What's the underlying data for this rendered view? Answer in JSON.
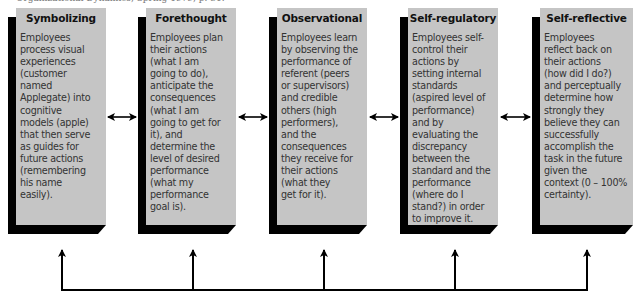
{
  "source_line": "Organizational Dynamics, Spring 1979, p. 31.",
  "boxes": [
    {
      "title": "Symbolizing",
      "text": "Employees\nprocess visual\nexperiences\n(customer\nnamed\nApplegate) into\ncognitive\nmodels (apple)\nthat then serve\nas guides for\nfuture actions\n(remembering\nhis name\neasily)."
    },
    {
      "title": "Forethought",
      "text": "Employees plan\ntheir actions\n(what I am\ngoing to do),\nanticipate the\nconsequences\n(what I am\ngoing to get for\nit), and\ndetermine the\nlevel of desired\nperformance\n(what my\nperformance\ngoal is)."
    },
    {
      "title": "Observational",
      "text": "Employees learn\nby observing the\nperformance of\nreferent (peers\nor supervisors)\nand credible\nothers (high\nperformers),\nand the\nconsequences\nthey receive for\ntheir actions\n(what they\nget for it)."
    },
    {
      "title": "Self-regulatory",
      "text": "Employees self-\ncontrol their\nactions by\nsetting internal\nstandards\n(aspired level of\nperformance)\nand by\nevaluating the\ndiscrepancy\nbetween the\nstandard and the\nperformance\n(where do I\nstand?) in order\nto improve it."
    },
    {
      "title": "Self-reflective",
      "text": "Employees\nreflect back on\ntheir actions\n(how did I do?)\nand perceptually\ndetermine how\nstrongly they\nbelieve they can\nsuccessfully\naccomplish the\ntask in the future\ngiven the\ncontext (0 – 100%\ncertainty)."
    }
  ],
  "connectors": {
    "between_boxes": "double-arrow",
    "bottom_feedback": "arrows-up-to-all-boxes"
  },
  "colors": {
    "box_face": "#c5c5c5",
    "box_shadow": "#000000",
    "title_text": "#111111",
    "body_text": "#333333",
    "arrow": "#000000"
  }
}
